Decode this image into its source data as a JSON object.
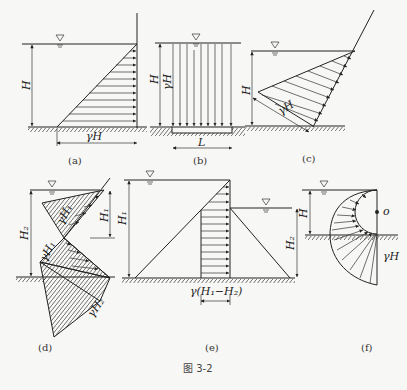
{
  "figure": {
    "caption": "图 3-2",
    "panels": [
      {
        "id": "a",
        "caption": "(a)",
        "labels": {
          "height": "H",
          "pressure": "γH"
        }
      },
      {
        "id": "b",
        "caption": "(b)",
        "labels": {
          "height": "H",
          "pressure": "γH",
          "length": "L"
        }
      },
      {
        "id": "c",
        "caption": "(c)",
        "labels": {
          "height": "H",
          "pressure": "γH"
        }
      },
      {
        "id": "d",
        "caption": "(d)",
        "labels": {
          "h1": "H₁",
          "h2": "H₂",
          "p1a": "γH₁",
          "p1b": "γH₁",
          "p2": "γH₂"
        }
      },
      {
        "id": "e",
        "caption": "(e)",
        "labels": {
          "h1": "H₁",
          "h2": "H₂",
          "diff": "γ(H₁−H₂)"
        }
      },
      {
        "id": "f",
        "caption": "(f)",
        "labels": {
          "height": "H",
          "center": "o",
          "pressure": "γH"
        }
      }
    ]
  },
  "colors": {
    "line": "#222222",
    "background": "#f7f7f5"
  }
}
